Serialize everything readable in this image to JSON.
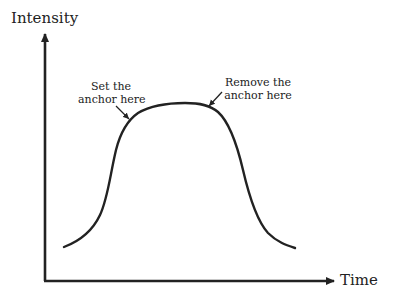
{
  "diagram": {
    "type": "intensity-vs-time",
    "axes": {
      "y_label": "Intensity",
      "x_label": "Time"
    },
    "curve": {
      "description": "bell-shaped plateau curve: rises steeply, flat plateau, falls steeply"
    },
    "annotations": [
      {
        "id": "set-anchor",
        "line1": "Set the",
        "line2": "anchor here"
      },
      {
        "id": "remove-anchor",
        "line1": "Remove the",
        "line2": "anchor here"
      }
    ],
    "colors": {
      "ink": "#222222",
      "background": "#ffffff"
    }
  }
}
